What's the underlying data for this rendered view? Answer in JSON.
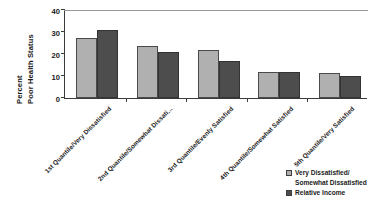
{
  "chart_data": {
    "type": "bar",
    "title": "",
    "xlabel": "",
    "ylabel": "Percent Poor Health Status",
    "ylabel_line1": "Percent",
    "ylabel_line2": "Poor Health Status",
    "ylim": [
      0,
      40
    ],
    "yticks": [
      0,
      10,
      20,
      30,
      40
    ],
    "ytick_labels": [
      "0",
      "10",
      "20",
      "30",
      "40"
    ],
    "grid": false,
    "legend_position": "bottom-right",
    "categories": [
      "1st Quantile/Very Dissatisfied",
      "2nd Quantile/Somewhat Dissati...",
      "3rd Quantile/Evenly Satisfied",
      "4th Quantile/Somewhat Satisfied",
      "5th Quantile/Very Satisfied"
    ],
    "series": [
      {
        "name": "Very Dissatisfied/\nSomewhat Dissatisfied",
        "color": "#b0b0b0",
        "values": [
          27.5,
          23.5,
          22.0,
          12.0,
          11.5
        ]
      },
      {
        "name": "Relative Income",
        "color": "#4d4d4d",
        "values": [
          31.0,
          21.0,
          17.0,
          12.0,
          10.0
        ]
      }
    ]
  },
  "legend": {
    "entries": [
      "Very Dissatisfied/\nSomewhat Dissatisfied",
      "Relative Income"
    ]
  }
}
